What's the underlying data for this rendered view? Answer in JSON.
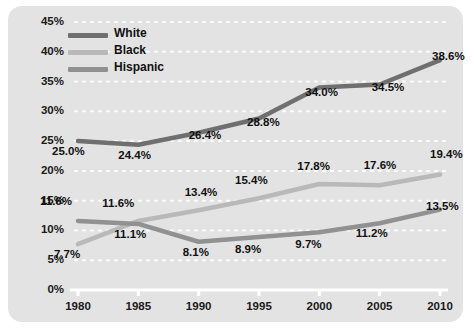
{
  "panel": {
    "background_color": "#e3e3e3",
    "plot_background_color": "#e3e3e3"
  },
  "legend": {
    "position": "top-left",
    "entries": [
      {
        "label": "White",
        "color": "#6f6f6f"
      },
      {
        "label": "Black",
        "color": "#b9b9b9"
      },
      {
        "label": "Hispanic",
        "color": "#919191"
      }
    ]
  },
  "axes": {
    "y_ticks": [
      "0%",
      "5%",
      "10%",
      "15%",
      "20%",
      "25%",
      "30%",
      "35%",
      "40%",
      "45%"
    ],
    "x_ticks": [
      "1980",
      "1985",
      "1990",
      "1995",
      "2000",
      "2005",
      "2010"
    ],
    "gridline_color": "#ffffff",
    "axis_color": "#ffffff"
  },
  "data_labels": {
    "white": [
      "25.0%",
      "24.4%",
      "26.4%",
      "28.8%",
      "34.0%",
      "34.5%",
      "38.6%"
    ],
    "black": [
      "7.7%",
      "11.6%",
      "13.4%",
      "15.4%",
      "17.8%",
      "17.6%",
      "19.4%"
    ],
    "hispanic": [
      "11.6%",
      "11.1%",
      "8.1%",
      "8.9%",
      "9.7%",
      "11.2%",
      "13.5%"
    ]
  },
  "chart_data": {
    "type": "line",
    "title": "",
    "subtitle": "",
    "xlabel": "",
    "ylabel": "",
    "x": [
      1980,
      1985,
      1990,
      1995,
      2000,
      2005,
      2010
    ],
    "categories": [
      "1980",
      "1985",
      "1990",
      "1995",
      "2000",
      "2005",
      "2010"
    ],
    "ylim": [
      0,
      45
    ],
    "y_tick_step": 5,
    "y_tick_values": [
      0,
      5,
      10,
      15,
      20,
      25,
      30,
      35,
      40,
      45
    ],
    "y_tick_labels": [
      "0%",
      "5%",
      "10%",
      "15%",
      "20%",
      "25%",
      "30%",
      "35%",
      "40%",
      "45%"
    ],
    "grid": "horizontal-dotted",
    "legend_position": "top-left",
    "value_suffix": "%",
    "series": [
      {
        "name": "White",
        "color": "#6f6f6f",
        "values": [
          25.0,
          24.4,
          26.4,
          28.8,
          34.0,
          34.5,
          38.6
        ],
        "labels": [
          "25.0%",
          "24.4%",
          "26.4%",
          "28.8%",
          "34.0%",
          "34.5%",
          "38.6%"
        ]
      },
      {
        "name": "Black",
        "color": "#b9b9b9",
        "values": [
          7.7,
          11.6,
          13.4,
          15.4,
          17.8,
          17.6,
          19.4
        ],
        "labels": [
          "7.7%",
          "11.6%",
          "13.4%",
          "15.4%",
          "17.8%",
          "17.6%",
          "19.4%"
        ]
      },
      {
        "name": "Hispanic",
        "color": "#919191",
        "values": [
          11.6,
          11.1,
          8.1,
          8.9,
          9.7,
          11.2,
          13.5
        ],
        "labels": [
          "11.6%",
          "11.1%",
          "8.1%",
          "8.9%",
          "9.7%",
          "11.2%",
          "13.5%"
        ]
      }
    ]
  }
}
